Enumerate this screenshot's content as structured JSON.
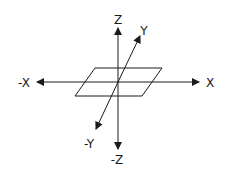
{
  "diagram": {
    "title": "",
    "stroke_color": "#1a1a1a",
    "background": "#ffffff",
    "axes": [
      {
        "name": "x-positive",
        "label": "X"
      },
      {
        "name": "x-negative",
        "label": "-X"
      },
      {
        "name": "y-positive",
        "label": "Y"
      },
      {
        "name": "y-negative",
        "label": "-Y"
      },
      {
        "name": "z-positive",
        "label": "Z"
      },
      {
        "name": "z-negative",
        "label": "-Z"
      }
    ],
    "plane": {
      "shape": "parallelogram",
      "description": "XY plane"
    }
  }
}
